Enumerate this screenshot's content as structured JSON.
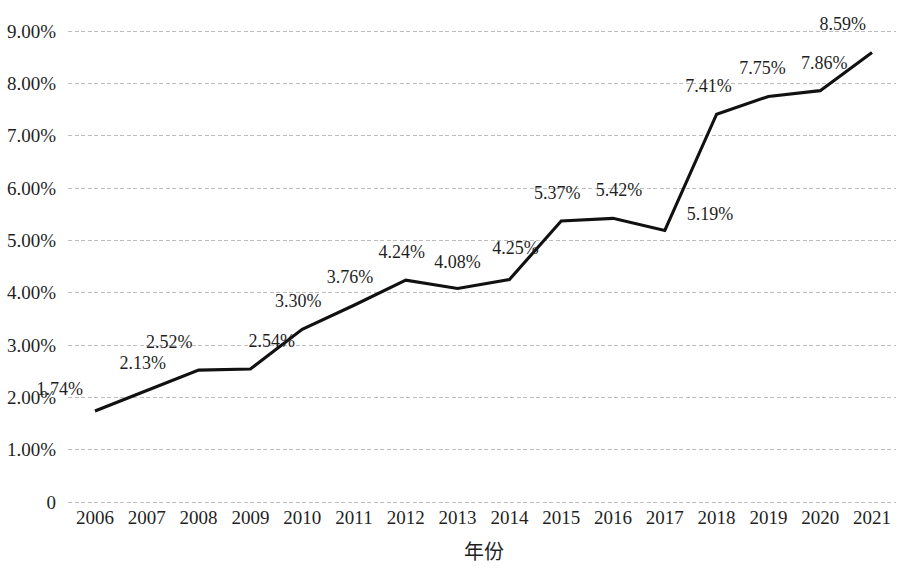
{
  "chart_data": {
    "type": "line",
    "title": "",
    "xlabel": "年份",
    "ylabel": "",
    "categories": [
      "2006",
      "2007",
      "2008",
      "2009",
      "2010",
      "2011",
      "2012",
      "2013",
      "2014",
      "2015",
      "2016",
      "2017",
      "2018",
      "2019",
      "2020",
      "2021"
    ],
    "values": [
      1.74,
      2.13,
      2.52,
      2.54,
      3.3,
      3.76,
      4.24,
      4.08,
      4.25,
      5.37,
      5.42,
      5.19,
      7.41,
      7.75,
      7.86,
      8.59
    ],
    "point_labels": [
      "1.74%",
      "2.13%",
      "2.52%",
      "2.54%",
      "3.30%",
      "3.76%",
      "4.24%",
      "4.08%",
      "4.25%",
      "5.37%",
      "5.42%",
      "5.19%",
      "7.41%",
      "7.75%",
      "7.86%",
      "8.59%"
    ],
    "ylim": [
      0,
      9
    ],
    "ytick_values": [
      0,
      1,
      2,
      3,
      4,
      5,
      6,
      7,
      8,
      9
    ],
    "ytick_labels": [
      "0",
      "1.00%",
      "2.00%",
      "3.00%",
      "4.00%",
      "5.00%",
      "6.00%",
      "7.00%",
      "8.00%",
      "9.00%"
    ],
    "grid": true,
    "grid_axis": "y",
    "legend": "none",
    "series_color": "#111111",
    "gridline_color": "#bdbdbd",
    "background_color": "#ffffff",
    "markers": false,
    "units": "percent"
  }
}
